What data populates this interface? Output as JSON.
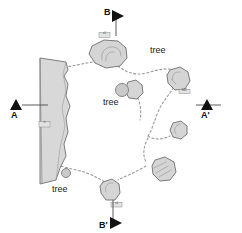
{
  "map": {
    "title": "Site plan map",
    "background_color": "#ffffff",
    "rock_fill": "#d5d5d5",
    "rock_stroke": "#6e6e6e",
    "cliff_fill": "#d8d8d8",
    "cliff_stroke": "#707070",
    "trail_color": "#9a9a9a",
    "tree_fill": "#c9c9c9",
    "tree_stroke": "#7a7a7a",
    "marker_color": "#111111"
  },
  "section_markers": [
    {
      "id": "b-top",
      "label": "B",
      "orientation": "down",
      "x": 100,
      "y": 8,
      "line_x1": 116,
      "line_y1": 16,
      "line_x2": 116,
      "line_y2": 36
    },
    {
      "id": "a-left",
      "label": "A",
      "orientation": "right",
      "x": 10,
      "y": 108,
      "line_x1": 22,
      "line_y1": 105,
      "line_x2": 48,
      "line_y2": 105
    },
    {
      "id": "a-prime",
      "label": "A'",
      "orientation": "right",
      "x": 222,
      "y": 108,
      "line_x1": 196,
      "line_y1": 105,
      "line_x2": 221,
      "line_y2": 105
    },
    {
      "id": "b-prime",
      "label": "B'",
      "orientation": "down",
      "x": 100,
      "y": 222,
      "line_x1": 113,
      "line_y1": 200,
      "line_x2": 113,
      "line_y2": 219
    }
  ],
  "tree_labels": [
    {
      "id": "tree-upper-right",
      "text": "tree",
      "x": 150,
      "y": 45
    },
    {
      "id": "tree-center",
      "text": "tree",
      "x": 103,
      "y": 97
    },
    {
      "id": "tree-lower-left",
      "text": "tree",
      "x": 52,
      "y": 184
    }
  ],
  "tree_symbols": [
    {
      "id": "tree-symbol-center",
      "cx": 122,
      "cy": 90,
      "r": 6.5
    },
    {
      "id": "tree-symbol-lower-left",
      "cx": 66,
      "cy": 173,
      "r": 4.5
    }
  ],
  "rock_tags": [
    {
      "id": "tag-north-boulder",
      "text": "a1",
      "x": 101,
      "y": 35
    },
    {
      "id": "tag-cliff-station",
      "text": "st",
      "x": 41,
      "y": 124
    },
    {
      "id": "tag-east-boulder",
      "text": "b12",
      "x": 181,
      "y": 92
    },
    {
      "id": "tag-south-boulder",
      "text": "c4",
      "x": 113,
      "y": 205
    }
  ],
  "features": {
    "cliff_name": "cliff-outcrop",
    "boulder_count": 8,
    "trail_name": "dashed-trail-network"
  }
}
